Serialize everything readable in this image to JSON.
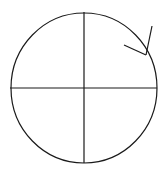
{
  "diagram": {
    "title": "",
    "background": "#ffffff",
    "stroke": "#1a1a1a",
    "circle": {
      "cx": 84,
      "cy": 88,
      "rx": 73,
      "ry": 75
    },
    "axes": {
      "vertical": {
        "x": 84,
        "y1": 12,
        "y2": 163
      },
      "horizontal": {
        "y": 88,
        "x1": 10,
        "x2": 157
      }
    },
    "arrow": {
      "tip": [
        146,
        55
      ],
      "shaft_end": [
        152,
        26
      ],
      "head_end": [
        124,
        45
      ],
      "direction": "clockwise"
    },
    "labels": []
  }
}
